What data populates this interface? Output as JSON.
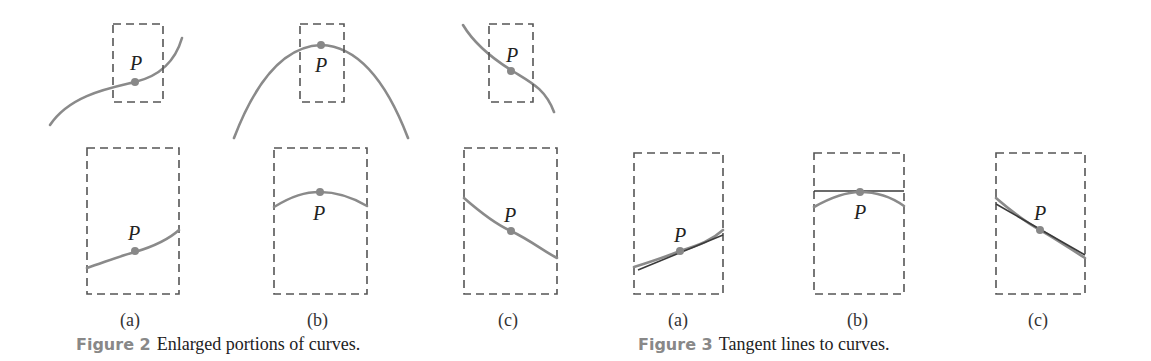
{
  "point_label": "P",
  "figure2": {
    "number": "Figure 2",
    "caption": "Enlarged portions of curves.",
    "panels": [
      {
        "label": "(a)"
      },
      {
        "label": "(b)"
      },
      {
        "label": "(c)"
      }
    ]
  },
  "figure3": {
    "number": "Figure 3",
    "caption": "Tangent lines to curves.",
    "panels": [
      {
        "label": "(a)"
      },
      {
        "label": "(b)"
      },
      {
        "label": "(c)"
      }
    ]
  },
  "colors": {
    "curve": "#8a8a8a",
    "tangent": "#3a3a3a",
    "caption_number": "#888888"
  }
}
